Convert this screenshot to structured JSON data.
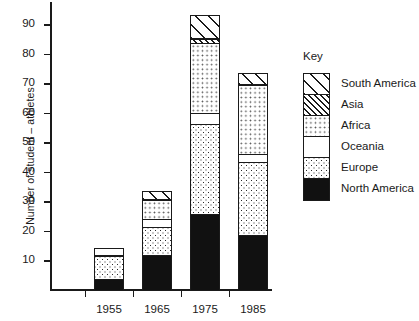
{
  "chart_data": {
    "type": "bar",
    "stacked": true,
    "title": "",
    "xlabel": "",
    "ylabel": "Number of student – athletes",
    "categories": [
      "1955",
      "1965",
      "1975",
      "1985"
    ],
    "ylim": [
      0,
      97
    ],
    "yticks": [
      10,
      20,
      30,
      40,
      50,
      60,
      70,
      80,
      90
    ],
    "grid": false,
    "legend_title": "Key",
    "legend_position": "right",
    "series": [
      {
        "name": "North America",
        "pattern": "solid-black",
        "color": "#111111",
        "values": [
          4,
          12,
          26,
          19
        ]
      },
      {
        "name": "Europe",
        "pattern": "dense-dots",
        "color": "#ffffff",
        "values": [
          8,
          10,
          31,
          25
        ]
      },
      {
        "name": "Oceania",
        "pattern": "blank-white",
        "color": "#ffffff",
        "values": [
          3,
          3,
          4,
          3
        ]
      },
      {
        "name": "Africa",
        "pattern": "light-dots",
        "color": "#ffffff",
        "values": [
          0,
          7,
          24,
          24
        ]
      },
      {
        "name": "Asia",
        "pattern": "dense-hatch",
        "color": "#ffffff",
        "values": [
          0,
          0,
          2,
          0
        ]
      },
      {
        "name": "South America",
        "pattern": "wide-hatch",
        "color": "#ffffff",
        "values": [
          0,
          3,
          8,
          4
        ]
      }
    ],
    "totals": [
      15,
      35,
      95,
      75
    ]
  },
  "axis": {
    "ytick_labels": [
      "90",
      "80",
      "70",
      "60",
      "50",
      "40",
      "30",
      "20",
      "10"
    ],
    "xtick_labels": [
      "1955",
      "1965",
      "1975",
      "1985"
    ],
    "ylabel": "Number of student – athletes"
  },
  "legend": {
    "title": "Key",
    "items": [
      {
        "label": "South America"
      },
      {
        "label": "Asia"
      },
      {
        "label": "Africa"
      },
      {
        "label": "Oceania"
      },
      {
        "label": "Europe"
      },
      {
        "label": "North America"
      }
    ]
  }
}
